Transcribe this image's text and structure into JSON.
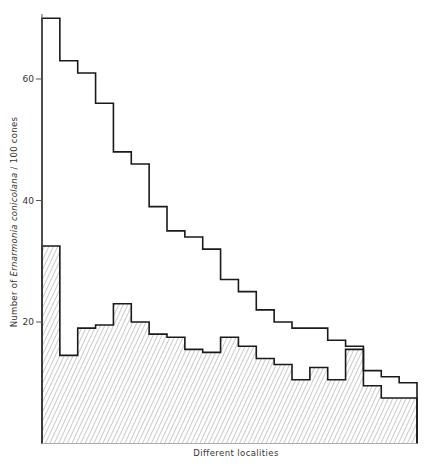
{
  "chart_data": {
    "type": "bar",
    "subtype": "step-histogram (overlaid)",
    "title": "",
    "xlabel": "Different localities",
    "ylabel_prefix": "Number of ",
    "ylabel_species": "Ernarmonia conicolana",
    "ylabel_suffix": " / 100 cones",
    "ylim": [
      0,
      72
    ],
    "yticks": [
      20,
      40,
      60
    ],
    "grid": false,
    "legend": null,
    "categories": [
      "1",
      "2",
      "3",
      "4",
      "5",
      "6",
      "7",
      "8",
      "9",
      "10",
      "11",
      "12",
      "13",
      "14",
      "15",
      "16",
      "17",
      "18",
      "19",
      "20",
      "21"
    ],
    "series": [
      {
        "name": "Total (open outline)",
        "style": "outline",
        "values": [
          70,
          63,
          61,
          56,
          48,
          46,
          39,
          35,
          34,
          32,
          27,
          25,
          22,
          20,
          19,
          19,
          17,
          16,
          12,
          11,
          10
        ]
      },
      {
        "name": "Hatched portion",
        "style": "hatched",
        "values": [
          32.5,
          14.5,
          19,
          19.5,
          23,
          20,
          18,
          17.5,
          15.5,
          15,
          17.5,
          16,
          14,
          13,
          10.5,
          12.5,
          10.5,
          15.5,
          9.5,
          7.5,
          7.5
        ]
      }
    ]
  },
  "colors": {
    "line": "#1a1a1a",
    "hatch": "#8a8a8a",
    "axis": "#555555",
    "background": "#ffffff"
  }
}
